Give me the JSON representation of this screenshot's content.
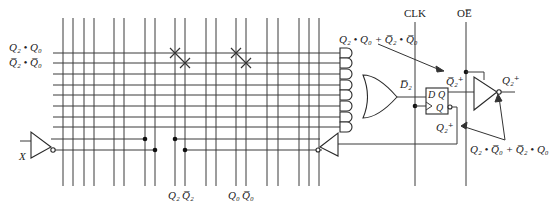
{
  "diagram": {
    "labels": {
      "row1_left": "Q₂ • Q₀",
      "row2_left": "Q̅₂ • Q̅₀",
      "and_output": "Q₂ • Q₀ + Q̅₂ • Q̅₀",
      "or_output": "D̅₂",
      "clk": "CLK",
      "oe": "OE̅",
      "ff_d": "D",
      "ff_q": "Q",
      "ff_qbar": "Q",
      "q2_plus_bar": "Q̅₂⁺",
      "q2_plus_out": "Q₂⁺",
      "q2_plus_fb": "Q₂⁺",
      "output_expr": "Q₂ • Q̅₀ + Q̅₂ • Q₀",
      "input_x": "X",
      "col_q2": "Q₂",
      "col_q2bar": "Q̅₂",
      "col_q0": "Q₀",
      "col_q0bar": "Q̅₀"
    },
    "grid": {
      "vertical_lines_x": [
        63,
        73,
        84,
        94,
        114,
        124,
        145,
        155,
        175,
        185,
        206,
        216,
        236,
        246,
        267,
        278,
        299,
        309,
        319
      ],
      "product_rows_y": [
        53,
        63,
        74,
        85,
        95,
        106,
        117,
        127
      ],
      "and_gate_count": 8,
      "fuse_crossings": [
        {
          "row": 1,
          "column": "Q2",
          "x": 175,
          "y": 53
        },
        {
          "row": 1,
          "column": "Q0",
          "x": 236,
          "y": 53
        },
        {
          "row": 2,
          "column": "Q2bar",
          "x": 185,
          "y": 63
        },
        {
          "row": 2,
          "column": "Q0bar",
          "x": 246,
          "y": 63
        }
      ]
    }
  }
}
